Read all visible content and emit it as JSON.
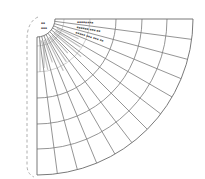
{
  "diagram": {
    "type": "polar-quarter-fan-grid",
    "origin_px": [
      37,
      19
    ],
    "outer_radius_px": 156,
    "hub_radius_px": 18,
    "ring_radii_px": [
      79,
      105,
      130,
      156
    ],
    "faint_inner_ring_radii_px": [
      27,
      53
    ],
    "sector_count": 12,
    "sector_angle_deg": 7.5,
    "colors": {
      "line": "#7a7a7a",
      "dashed": "#9a9a9a",
      "background": "#ffffff"
    },
    "hub_labels": [
      "▪▪",
      "▪▪▪"
    ],
    "ray_labels_top": [
      "▪▪▪▪▪▪▪▪",
      "▪▪▪▪▪▪ ▪▪▪ ▪▪",
      "▪▪▪▪▪ ▪▪▪ ▪▪▪ ▪▪"
    ],
    "note": "Labels in the original image are illegible at this resolution; rendered as placeholder marks."
  }
}
